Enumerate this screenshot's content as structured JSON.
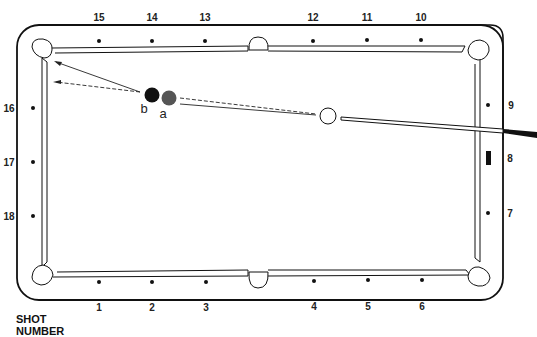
{
  "diagram": {
    "type": "billiard-table-shot-diagram",
    "shot_title": "SHOT",
    "shot_subtitle": "NUMBER",
    "diamonds": {
      "top": [
        {
          "label": "15",
          "x": 99
        },
        {
          "label": "14",
          "x": 152
        },
        {
          "label": "13",
          "x": 205
        },
        {
          "label": "12",
          "x": 313
        },
        {
          "label": "11",
          "x": 367
        },
        {
          "label": "10",
          "x": 421
        }
      ],
      "bottom": [
        {
          "label": "1",
          "x": 99
        },
        {
          "label": "2",
          "x": 152
        },
        {
          "label": "3",
          "x": 206
        },
        {
          "label": "4",
          "x": 314
        },
        {
          "label": "5",
          "x": 368
        },
        {
          "label": "6",
          "x": 422
        }
      ],
      "left": [
        {
          "label": "16",
          "y": 108
        },
        {
          "label": "17",
          "y": 162
        },
        {
          "label": "18",
          "y": 216
        }
      ],
      "right": [
        {
          "label": "9",
          "y": 105
        },
        {
          "label": "8",
          "y": 158,
          "marker": "bar"
        },
        {
          "label": "7",
          "y": 213
        }
      ]
    },
    "balls": [
      {
        "id": "b",
        "label": "b",
        "color": "#111111",
        "x": 152,
        "y": 95
      },
      {
        "id": "a",
        "label": "a",
        "color": "#555555",
        "x": 169,
        "y": 98
      },
      {
        "id": "cue",
        "label": "",
        "color": "#ffffff",
        "x": 328,
        "y": 116
      }
    ],
    "paths": [
      {
        "name": "object-ball-b-path",
        "style": "solid",
        "from": [
          140,
          92
        ],
        "to": [
          54,
          61
        ]
      },
      {
        "name": "object-ball-a-path",
        "style": "dashed",
        "from": [
          140,
          92
        ],
        "to": [
          53,
          82
        ]
      },
      {
        "name": "aim-line-solid",
        "style": "solid",
        "from": [
          180,
          103
        ],
        "to": [
          318,
          115
        ]
      },
      {
        "name": "aim-line-dashed",
        "style": "dashed",
        "from": [
          180,
          98
        ],
        "to": [
          318,
          113
        ]
      }
    ],
    "colors": {
      "line": "#111111",
      "ball_a": "#555555",
      "ball_b": "#111111",
      "cue_stick_butt": "#111111"
    }
  }
}
